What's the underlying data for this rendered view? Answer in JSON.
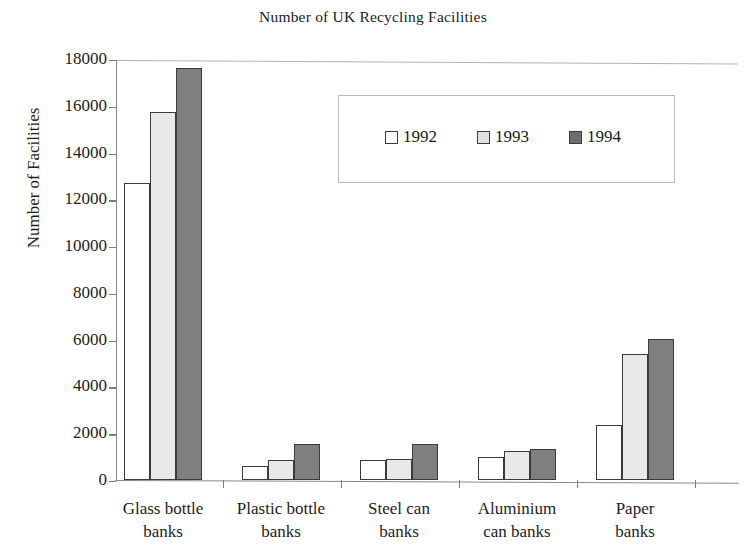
{
  "chart_data": {
    "type": "bar",
    "title": "Number of UK Recycling Facilities",
    "xlabel": "",
    "ylabel": "Number of Facilities",
    "ylim": [
      0,
      18000
    ],
    "ytick_step": 2000,
    "yticks": [
      0,
      2000,
      4000,
      6000,
      8000,
      10000,
      12000,
      14000,
      16000,
      18000
    ],
    "ytick_labels": [
      "0",
      "2000",
      "4000",
      "6000",
      "8000",
      "10000",
      "12000",
      "14000",
      "16000",
      "18000"
    ],
    "grid": false,
    "legend_position": "upper center inside",
    "categories": [
      "Glass bottle banks",
      "Plastic bottle banks",
      "Steel can banks",
      "Aluminium can banks",
      "Paper banks"
    ],
    "category_lines": [
      [
        "Glass bottle",
        "banks"
      ],
      [
        "Plastic bottle",
        "banks"
      ],
      [
        "Steel can",
        "banks"
      ],
      [
        "Aluminium",
        "can banks"
      ],
      [
        "Paper",
        "banks"
      ]
    ],
    "series": [
      {
        "name": "1992",
        "color": "#ffffff",
        "values": [
          12700,
          600,
          850,
          1000,
          2350
        ]
      },
      {
        "name": "1993",
        "color": "#e9e9e9",
        "values": [
          15750,
          860,
          880,
          1250,
          5400
        ]
      },
      {
        "name": "1994",
        "color": "#7f7f7f",
        "values": [
          17600,
          1520,
          1550,
          1330,
          6050
        ]
      }
    ]
  },
  "legend": {
    "items": [
      {
        "label": "1992"
      },
      {
        "label": "1993"
      },
      {
        "label": "1994"
      }
    ]
  },
  "colors": {
    "series_1992": "#ffffff",
    "series_1993": "#e9e9e9",
    "series_1994": "#7f7f7f",
    "bar_outline": "#3b3b3b",
    "axis": "#8a8a8a",
    "text": "#1d1d1d",
    "background": "#ffffff"
  }
}
